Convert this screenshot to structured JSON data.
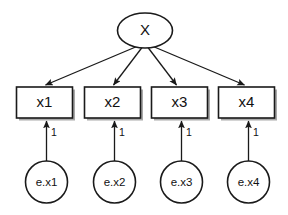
{
  "diagram": {
    "type": "sem-path-diagram",
    "background_color": "#ffffff",
    "stroke_color": "#1a1a1a",
    "shadow_color": "#9a9a9a",
    "latent": {
      "id": "X",
      "label": "X",
      "shape": "ellipse",
      "cx": 145,
      "cy": 30.5,
      "rx": 27.5,
      "ry": 17.5
    },
    "observed": [
      {
        "id": "x1",
        "label": "x1",
        "x": 16.5,
        "y": 87,
        "w": 56,
        "h": 31
      },
      {
        "id": "x2",
        "label": "x2",
        "x": 84.5,
        "y": 87,
        "w": 56,
        "h": 31
      },
      {
        "id": "x3",
        "label": "x3",
        "x": 151.5,
        "y": 87,
        "w": 56,
        "h": 31
      },
      {
        "id": "x4",
        "label": "x4",
        "x": 218.5,
        "y": 87,
        "w": 56,
        "h": 31
      }
    ],
    "errors": [
      {
        "id": "e.x1",
        "label": "e.x1",
        "cx": 46.5,
        "cy": 182,
        "r": 21
      },
      {
        "id": "e.x2",
        "label": "e.x2",
        "cx": 114.5,
        "cy": 182,
        "r": 21
      },
      {
        "id": "e.x3",
        "label": "e.x3",
        "cx": 181.5,
        "cy": 182,
        "r": 21
      },
      {
        "id": "e.x4",
        "label": "e.x4",
        "cx": 248.5,
        "cy": 182,
        "r": 21
      }
    ],
    "loading_paths": [
      {
        "id": "X->x1",
        "from": "X",
        "to": "x1",
        "label": "",
        "x1": 138,
        "y1": 46,
        "x2": 45.5,
        "y2": 85
      },
      {
        "id": "X->x2",
        "from": "X",
        "to": "x2",
        "label": "",
        "x1": 142,
        "y1": 47.5,
        "x2": 113.5,
        "y2": 85
      },
      {
        "id": "X->x3",
        "from": "X",
        "to": "x3",
        "label": "",
        "x1": 148,
        "y1": 47.5,
        "x2": 176.5,
        "y2": 85
      },
      {
        "id": "X->x4",
        "from": "X",
        "to": "x4",
        "label": "",
        "x1": 152,
        "y1": 46,
        "x2": 244.5,
        "y2": 85
      }
    ],
    "error_paths": [
      {
        "id": "e.x1->x1",
        "from": "e.x1",
        "to": "x1",
        "label": "1",
        "x": 46.5,
        "y1": 161,
        "y2": 121,
        "label_x": 51,
        "label_y": 133
      },
      {
        "id": "e.x2->x2",
        "from": "e.x2",
        "to": "x2",
        "label": "1",
        "x": 114.5,
        "y1": 161,
        "y2": 121,
        "label_x": 119,
        "label_y": 133
      },
      {
        "id": "e.x3->x3",
        "from": "e.x3",
        "to": "x3",
        "label": "1",
        "x": 181.5,
        "y1": 161,
        "y2": 121,
        "label_x": 186,
        "label_y": 133
      },
      {
        "id": "e.x4->x4",
        "from": "e.x4",
        "to": "x4",
        "label": "1",
        "x": 248.5,
        "y1": 161,
        "y2": 121,
        "label_x": 253,
        "label_y": 133
      }
    ]
  }
}
